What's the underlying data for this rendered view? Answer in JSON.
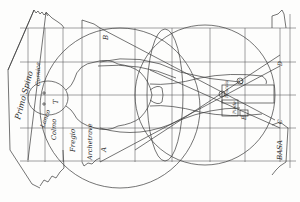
{
  "figure": {
    "ink_color": "#3a3a3a",
    "paper_color": "#fdfdfc"
  },
  "labels": {
    "primo_spino": "Primo Spino",
    "lanco": "Lanco",
    "colmo": "Colmo",
    "fregio": "Fregio",
    "archetrave": "Archetrave",
    "basa": "BASA",
    "cornice_top": "Cornice",
    "body_note": "Braccia",
    "foot_note": "Piede"
  },
  "letters": {
    "a": "A",
    "b": "B",
    "c": "C",
    "d": "D",
    "e": "E",
    "g": "G",
    "t": "T"
  }
}
